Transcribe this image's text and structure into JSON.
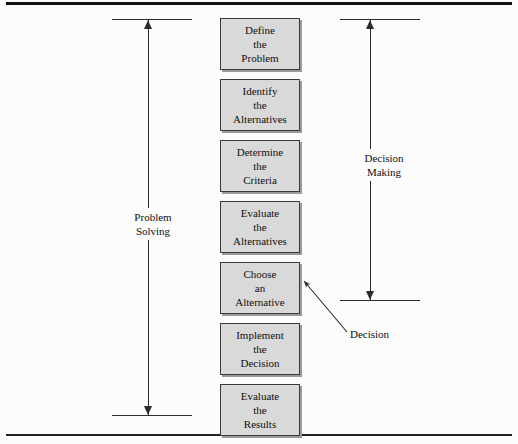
{
  "figure": {
    "background_color": "#fcfcfc",
    "box_fill_color": "#d9d9d9",
    "box_border_color": "#3a3a3a",
    "line_color": "#2b2b2b",
    "text_color": "#101010"
  },
  "steps": [
    {
      "id": "define-the-problem",
      "lines": [
        "Define",
        "the",
        "Problem"
      ]
    },
    {
      "id": "identify-the-alternatives",
      "lines": [
        "Identify",
        "the",
        "Alternatives"
      ]
    },
    {
      "id": "determine-the-criteria",
      "lines": [
        "Determine",
        "the",
        "Criteria"
      ]
    },
    {
      "id": "evaluate-the-alternatives",
      "lines": [
        "Evaluate",
        "the",
        "Alternatives"
      ]
    },
    {
      "id": "choose-an-alternative",
      "lines": [
        "Choose",
        "an",
        "Alternative"
      ]
    },
    {
      "id": "implement-the-decision",
      "lines": [
        "Implement",
        "the",
        "Decision"
      ]
    },
    {
      "id": "evaluate-the-results",
      "lines": [
        "Evaluate",
        "the",
        "Results"
      ]
    }
  ],
  "brackets": {
    "left": {
      "id": "problem-solving",
      "lines": [
        "Problem",
        "Solving"
      ],
      "spans_steps": [
        "define-the-problem",
        "evaluate-the-results"
      ]
    },
    "right": {
      "id": "decision-making",
      "lines": [
        "Decision",
        "Making"
      ],
      "spans_steps": [
        "define-the-problem",
        "choose-an-alternative"
      ]
    }
  },
  "callout": {
    "id": "decision-callout",
    "label": "Decision",
    "points_to": "choose-an-alternative"
  }
}
